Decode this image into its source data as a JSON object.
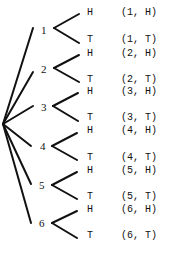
{
  "diagram": {
    "type": "tree-diagram",
    "root": {
      "x": 3,
      "y": 124
    },
    "line_color": "#111111",
    "first_stage": [
      {
        "label": "1",
        "x": 44,
        "y": 30,
        "branch_end": {
          "x": 33,
          "y": 28
        }
      },
      {
        "label": "2",
        "x": 44,
        "y": 69,
        "branch_end": {
          "x": 33,
          "y": 72
        }
      },
      {
        "label": "3",
        "x": 44,
        "y": 107,
        "branch_end": {
          "x": 33,
          "y": 106
        }
      },
      {
        "label": "4",
        "x": 43,
        "y": 146,
        "branch_end": {
          "x": 31,
          "y": 146
        }
      },
      {
        "label": "5",
        "x": 42,
        "y": 185,
        "branch_end": {
          "x": 31,
          "y": 184
        }
      },
      {
        "label": "6",
        "x": 42,
        "y": 223,
        "branch_end": {
          "x": 31,
          "y": 223
        }
      }
    ],
    "second_stage": [
      {
        "parent": "1",
        "vertex": {
          "x": 54,
          "y": 28
        },
        "H": {
          "tip": {
            "x": 79,
            "y": 14
          },
          "label": "H",
          "outcome": "(1, H)",
          "y": 13
        },
        "T": {
          "tip": {
            "x": 79,
            "y": 43
          },
          "label": "T",
          "outcome": "(1, T)",
          "y": 40
        }
      },
      {
        "parent": "2",
        "vertex": {
          "x": 54,
          "y": 68
        },
        "H": {
          "tip": {
            "x": 79,
            "y": 55
          },
          "label": "H",
          "outcome": "(2, H)",
          "y": 54
        },
        "T": {
          "tip": {
            "x": 79,
            "y": 82
          },
          "label": "T",
          "outcome": "(2, T)",
          "y": 80
        }
      },
      {
        "parent": "3",
        "vertex": {
          "x": 53,
          "y": 106
        },
        "H": {
          "tip": {
            "x": 78,
            "y": 93
          },
          "label": "H",
          "outcome": "(3, H)",
          "y": 92
        },
        "T": {
          "tip": {
            "x": 78,
            "y": 121
          },
          "label": "T",
          "outcome": "(3, T)",
          "y": 118
        }
      },
      {
        "parent": "4",
        "vertex": {
          "x": 52,
          "y": 146
        },
        "H": {
          "tip": {
            "x": 77,
            "y": 133
          },
          "label": "H",
          "outcome": "(4, H)",
          "y": 131
        },
        "T": {
          "tip": {
            "x": 77,
            "y": 160
          },
          "label": "T",
          "outcome": "(4, T)",
          "y": 158
        }
      },
      {
        "parent": "5",
        "vertex": {
          "x": 52,
          "y": 185
        },
        "H": {
          "tip": {
            "x": 77,
            "y": 172
          },
          "label": "H",
          "outcome": "(5, H)",
          "y": 171
        },
        "T": {
          "tip": {
            "x": 77,
            "y": 199
          },
          "label": "T",
          "outcome": "(5, T)",
          "y": 197
        }
      },
      {
        "parent": "6",
        "vertex": {
          "x": 52,
          "y": 223
        },
        "H": {
          "tip": {
            "x": 77,
            "y": 211
          },
          "label": "H",
          "outcome": "(6, H)",
          "y": 210
        },
        "T": {
          "tip": {
            "x": 77,
            "y": 238
          },
          "label": "T",
          "outcome": "(6, T)",
          "y": 236
        }
      }
    ],
    "ht_label_x": 87,
    "outcome_x": 121
  }
}
